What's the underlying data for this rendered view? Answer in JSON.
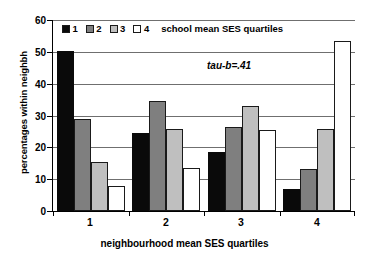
{
  "chart_data": {
    "type": "bar",
    "title": "",
    "xlabel": "neighbourhood mean SES quartiles",
    "ylabel": "percentages within neighbh",
    "categories": [
      "1",
      "2",
      "3",
      "4"
    ],
    "ylim": [
      0,
      60
    ],
    "yticks": [
      0,
      10,
      20,
      30,
      40,
      50,
      60
    ],
    "ytick_labels": [
      "0",
      "10",
      "20",
      "30",
      "40",
      "50",
      "60"
    ],
    "grid": true,
    "legend_position": "top-left-inside",
    "legend_title": "school mean SES quartiles",
    "annotations": [
      "tau-b=.41"
    ],
    "series": [
      {
        "name": "1",
        "color": "#0a0a0a",
        "values": [
          50.3,
          24.5,
          18.5,
          7.0
        ]
      },
      {
        "name": "2",
        "color": "#7f7f7f",
        "values": [
          28.9,
          34.5,
          26.4,
          13.3
        ]
      },
      {
        "name": "3",
        "color": "#bfbfbf",
        "values": [
          15.3,
          25.7,
          33.1,
          25.7
        ]
      },
      {
        "name": "4",
        "color": "#ffffff",
        "values": [
          8.0,
          13.4,
          25.4,
          53.4
        ]
      }
    ]
  }
}
